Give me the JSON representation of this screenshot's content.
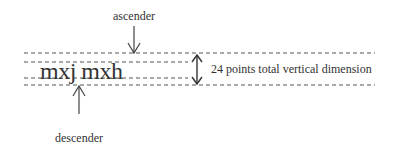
{
  "diagram": {
    "ascender_label": "ascender",
    "descender_label": "descender",
    "sample_text": "mxj mxh",
    "dimension_label": "24 points total vertical dimension",
    "colors": {
      "text": "#333333",
      "lines": "#555555",
      "background": "#ffffff"
    }
  }
}
